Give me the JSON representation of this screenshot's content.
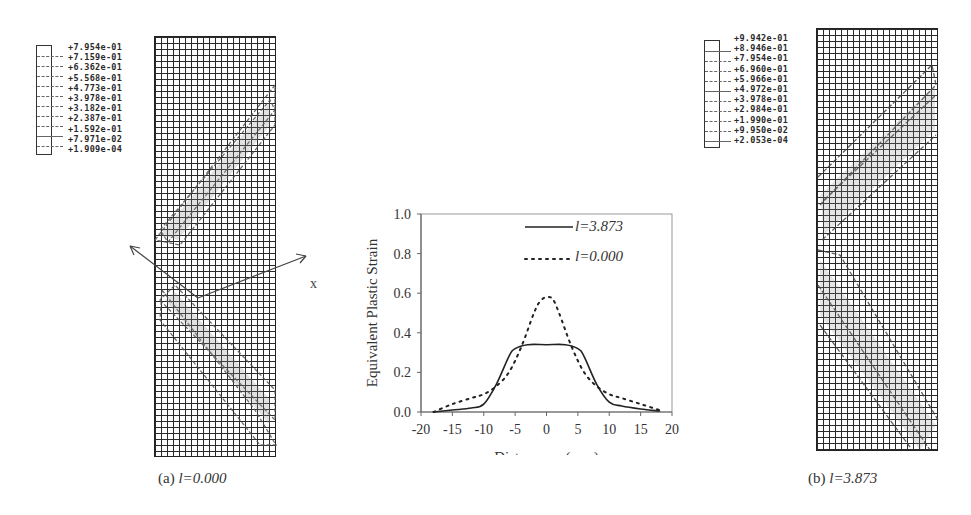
{
  "figure": {
    "panel_a": {
      "caption_prefix": "(a) ",
      "caption_value": "l=0.000",
      "legend_values": [
        "+7.954e-01",
        "+7.159e-01",
        "+6.362e-01",
        "+5.568e-01",
        "+4.773e-01",
        "+3.978e-01",
        "+3.182e-01",
        "+2.387e-01",
        "+1.592e-01",
        "+7.971e-02",
        "+1.909e-04"
      ]
    },
    "panel_b": {
      "caption_prefix": "(b) ",
      "caption_value": "l=3.873",
      "legend_values": [
        "+9.942e-01",
        "+8.946e-01",
        "+7.954e-01",
        "+6.960e-01",
        "+5.966e-01",
        "+4.972e-01",
        "+3.978e-01",
        "+2.984e-01",
        "+1.990e-01",
        "+9.950e-02",
        "+2.053e-04"
      ]
    },
    "axis_label_x": "x",
    "colors": {
      "ink": "#222222",
      "grid": "#2a2a2a",
      "background": "#ffffff"
    }
  },
  "chart_data": {
    "type": "line",
    "title": "",
    "xlabel": "Distance, x (mm)",
    "ylabel": "Equivalent Plastic Strain",
    "xlim": [
      -20,
      20
    ],
    "ylim": [
      0.0,
      1.0
    ],
    "xticks": [
      "-20",
      "-15",
      "-10",
      "-5",
      "0",
      "5",
      "10",
      "15",
      "20"
    ],
    "yticks": [
      "0.0",
      "0.2",
      "0.4",
      "0.6",
      "0.8",
      "1.0"
    ],
    "grid": false,
    "legend_position": "upper right",
    "series": [
      {
        "name": "l=3.873",
        "style": "solid",
        "x": [
          -18,
          -15,
          -12,
          -10,
          -8,
          -6,
          -5,
          -3,
          0,
          3,
          5,
          6,
          8,
          10,
          12,
          15,
          18
        ],
        "y": [
          0.0,
          0.01,
          0.02,
          0.04,
          0.14,
          0.28,
          0.32,
          0.34,
          0.34,
          0.34,
          0.32,
          0.28,
          0.14,
          0.05,
          0.03,
          0.015,
          0.005
        ]
      },
      {
        "name": "l=0.000",
        "style": "dotted",
        "x": [
          -18,
          -15,
          -12,
          -10,
          -8,
          -6,
          -4,
          -2,
          -1,
          0,
          1,
          2,
          4,
          6,
          8,
          10,
          12,
          15,
          18
        ],
        "y": [
          0.0,
          0.04,
          0.07,
          0.09,
          0.13,
          0.2,
          0.33,
          0.5,
          0.56,
          0.58,
          0.57,
          0.5,
          0.33,
          0.2,
          0.13,
          0.09,
          0.07,
          0.04,
          0.01
        ]
      }
    ]
  }
}
